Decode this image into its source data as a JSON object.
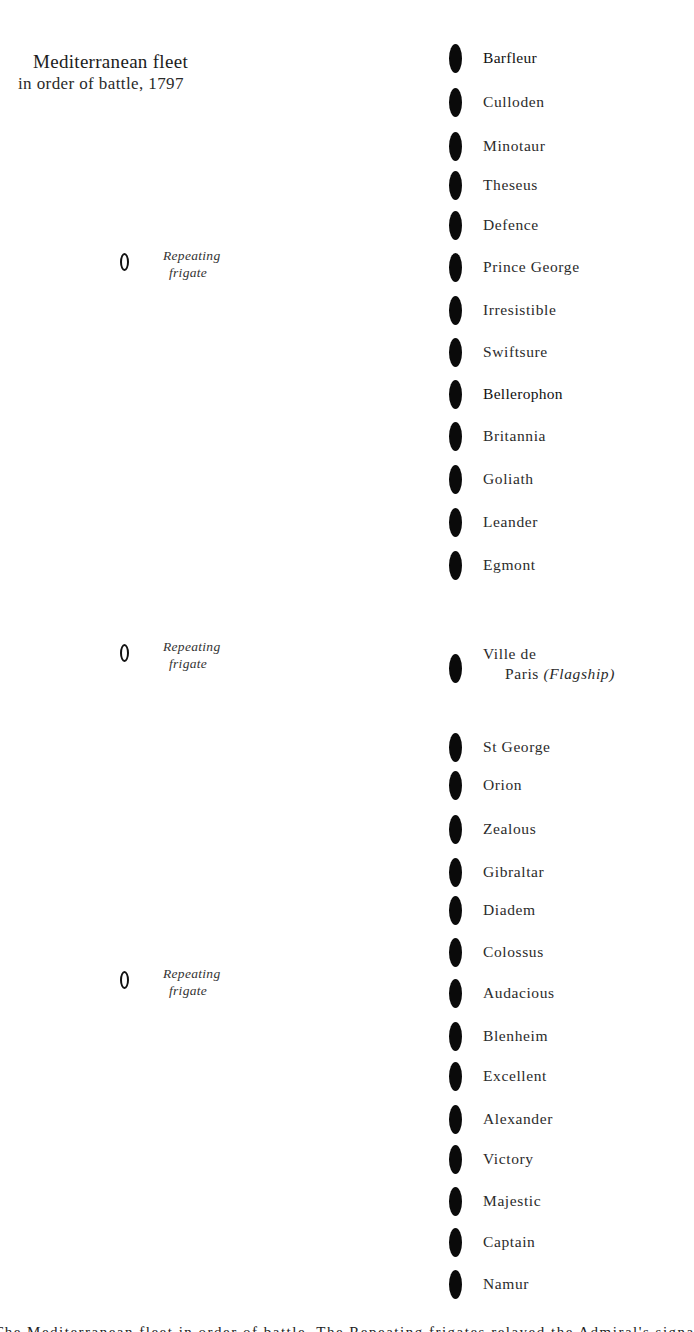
{
  "header": {
    "title": "Mediterranean fleet",
    "subtitle": "in order of battle, 1797"
  },
  "frigates": [
    {
      "icon": "hollow-ellipse-icon",
      "line1": "Repeating",
      "line2": "frigate"
    },
    {
      "icon": "hollow-ellipse-icon",
      "line1": "Repeating",
      "line2": "frigate"
    },
    {
      "icon": "hollow-ellipse-icon",
      "line1": "Repeating",
      "line2": "frigate"
    }
  ],
  "ships": [
    {
      "name": "Barfleur"
    },
    {
      "name": "Culloden"
    },
    {
      "name": "Minotaur"
    },
    {
      "name": "Theseus"
    },
    {
      "name": "Defence"
    },
    {
      "name": "Prince George"
    },
    {
      "name": "Irresistible"
    },
    {
      "name": "Swiftsure"
    },
    {
      "name": "Bellerophon"
    },
    {
      "name": "Britannia"
    },
    {
      "name": "Goliath"
    },
    {
      "name": "Leander"
    },
    {
      "name": "Egmont"
    },
    {
      "name": "Ville de",
      "name_line2": "Paris",
      "note": "(Flagship)"
    },
    {
      "name": "St George"
    },
    {
      "name": "Orion"
    },
    {
      "name": "Zealous"
    },
    {
      "name": "Gibraltar"
    },
    {
      "name": "Diadem"
    },
    {
      "name": "Colossus"
    },
    {
      "name": "Audacious"
    },
    {
      "name": "Blenheim"
    },
    {
      "name": "Excellent"
    },
    {
      "name": "Alexander"
    },
    {
      "name": "Victory"
    },
    {
      "name": "Majestic"
    },
    {
      "name": "Captain"
    },
    {
      "name": "Namur"
    }
  ],
  "legend": {
    "ship_icon": "filled-ellipse-icon",
    "frigate_icon": "hollow-ellipse-icon"
  },
  "caption": "The Mediterranean fleet in order of battle. The Repeating frigates relayed the Admiral's signals along the line"
}
